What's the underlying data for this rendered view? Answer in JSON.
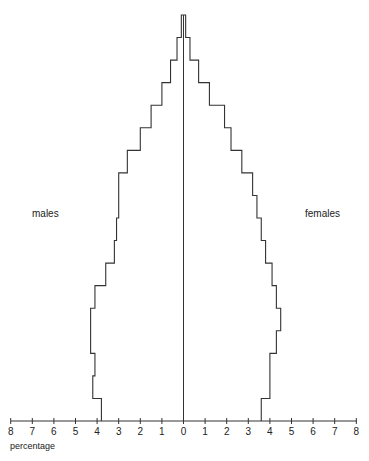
{
  "chart_data": {
    "type": "bar",
    "subtype": "population-pyramid",
    "title": "",
    "xlabel": "percentage",
    "ylabel": "",
    "left_label": "males",
    "right_label": "females",
    "xlim": [
      -8,
      8
    ],
    "x_tick_labels": [
      "8",
      "7",
      "6",
      "5",
      "4",
      "3",
      "2",
      "1",
      "0",
      "1",
      "2",
      "3",
      "4",
      "5",
      "6",
      "7",
      "8"
    ],
    "grid": false,
    "bands_order": "bottom-to-top",
    "series": [
      {
        "name": "males",
        "values": [
          3.8,
          4.2,
          4.1,
          4.3,
          4.3,
          4.1,
          3.6,
          3.2,
          3.1,
          3.0,
          3.0,
          2.6,
          2.0,
          1.5,
          1.0,
          0.6,
          0.3,
          0.1
        ]
      },
      {
        "name": "females",
        "values": [
          3.6,
          4.0,
          4.0,
          4.3,
          4.5,
          4.3,
          4.1,
          3.8,
          3.6,
          3.4,
          3.2,
          2.7,
          2.2,
          1.9,
          1.2,
          0.7,
          0.3,
          0.1
        ]
      }
    ]
  },
  "labels": {
    "males": "males",
    "females": "females",
    "xlabel": "percentage"
  }
}
